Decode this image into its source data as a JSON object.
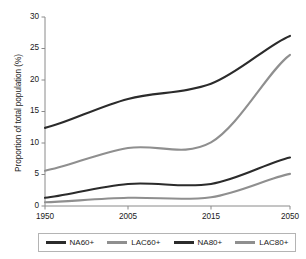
{
  "chart_data": {
    "type": "line",
    "title": "",
    "subtitle": "",
    "xlabel": "",
    "ylabel": "Proportion of total population (%)",
    "x": [
      1950,
      2005,
      2015,
      2050
    ],
    "xticklabels": [
      "1950",
      "2005",
      "2015",
      "2050"
    ],
    "yticks": [
      0,
      5,
      10,
      15,
      20,
      25,
      30
    ],
    "yticklabels": [
      "0",
      "5",
      "10",
      "15",
      "20",
      "25",
      "30"
    ],
    "ylim": [
      0,
      30
    ],
    "grid": false,
    "legend_position": "bottom",
    "series": [
      {
        "name": "NA60+",
        "color": "#2b2b2b",
        "values": [
          12.4,
          17.0,
          19.4,
          27.0
        ]
      },
      {
        "name": "LAC60+",
        "color": "#8f8f8f",
        "values": [
          5.6,
          9.2,
          10.1,
          24.0
        ]
      },
      {
        "name": "NA80+",
        "color": "#2b2b2b",
        "values": [
          1.3,
          3.5,
          3.5,
          7.7
        ]
      },
      {
        "name": "LAC80+",
        "color": "#8f8f8f",
        "values": [
          0.6,
          1.3,
          1.4,
          5.1
        ]
      }
    ]
  },
  "axis": {
    "yticks": [
      {
        "label": "30",
        "value": 30
      },
      {
        "label": "25",
        "value": 25
      },
      {
        "label": "20",
        "value": 20
      },
      {
        "label": "15",
        "value": 15
      },
      {
        "label": "10",
        "value": 10
      },
      {
        "label": "5",
        "value": 5
      },
      {
        "label": "0",
        "value": 0
      }
    ],
    "xticks": [
      {
        "label": "1950",
        "value": 1950
      },
      {
        "label": "2005",
        "value": 2005
      },
      {
        "label": "2015",
        "value": 2015
      },
      {
        "label": "2050",
        "value": 2050
      }
    ],
    "ylabel": "Proportion of total population (%)"
  },
  "legend": {
    "items": [
      {
        "label": "NA60+",
        "color": "#2b2b2b"
      },
      {
        "label": "LAC60+",
        "color": "#8f8f8f"
      },
      {
        "label": "NA80+",
        "color": "#2b2b2b"
      },
      {
        "label": "LAC80+",
        "color": "#8f8f8f"
      }
    ]
  },
  "colors": {
    "north_america": "#2b2b2b",
    "latin_america_caribbean": "#8f8f8f",
    "axis": "#8a8a8a",
    "text": "#1a1a1a",
    "background": "#ffffff"
  }
}
